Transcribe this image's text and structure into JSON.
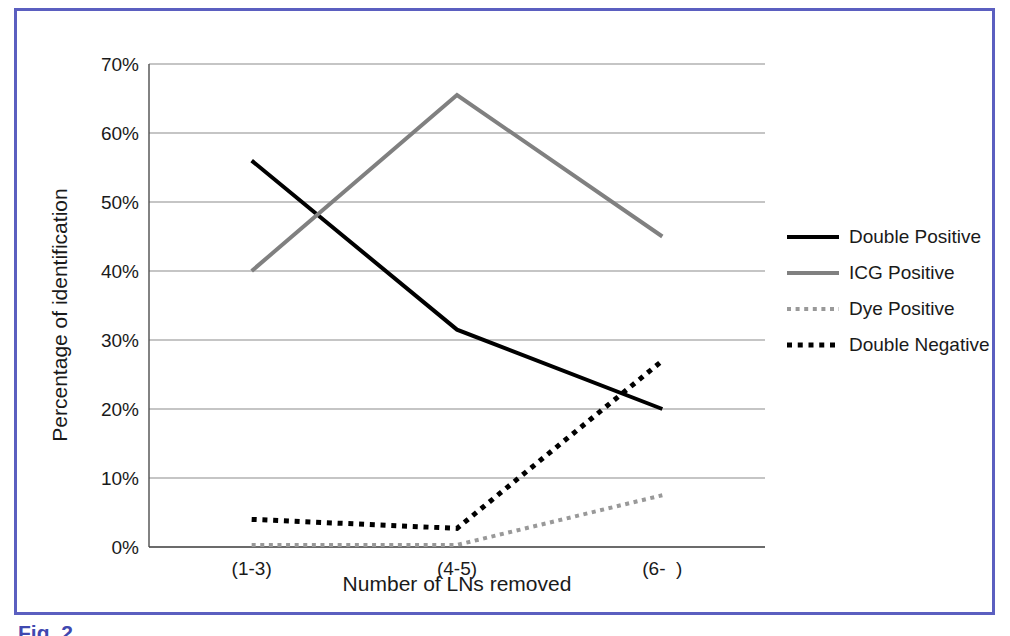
{
  "figure": {
    "border_color": "#5b5fc0",
    "caption": "Fig. 2"
  },
  "chart_data": {
    "type": "line",
    "title": "",
    "xlabel": "Number of LNs removed",
    "ylabel": "Percentage of identification",
    "categories": [
      "(1-3)",
      "(4-5)",
      "(6-  )"
    ],
    "ylim": [
      0,
      70
    ],
    "ytick_labels": [
      "0%",
      "10%",
      "20%",
      "30%",
      "40%",
      "50%",
      "60%",
      "70%"
    ],
    "ytick_values": [
      0,
      10,
      20,
      30,
      40,
      50,
      60,
      70
    ],
    "grid": true,
    "legend_position": "right",
    "series": [
      {
        "name": "Double Positive",
        "values": [
          56,
          31.5,
          20
        ],
        "color": "#000000",
        "style": "solid",
        "width": 4
      },
      {
        "name": "ICG Positive",
        "values": [
          40,
          65.5,
          45
        ],
        "color": "#808080",
        "style": "solid",
        "width": 4
      },
      {
        "name": "Dye Positive",
        "values": [
          0.3,
          0.3,
          7.5
        ],
        "color": "#999999",
        "style": "dotted",
        "width": 4
      },
      {
        "name": "Double Negative",
        "values": [
          4,
          2.7,
          27
        ],
        "color": "#000000",
        "style": "dotted",
        "width": 5
      }
    ]
  },
  "plot_geometry": {
    "left": 132,
    "right": 748,
    "top": 53,
    "bottom": 536
  }
}
